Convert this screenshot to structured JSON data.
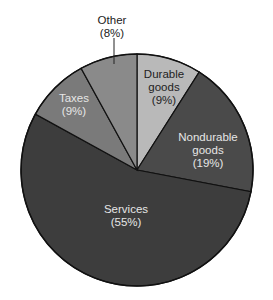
{
  "chart_data": {
    "type": "pie",
    "title": "",
    "categories": [
      "Durable goods",
      "Nondurable goods",
      "Services",
      "Taxes",
      "Other"
    ],
    "values": [
      9,
      19,
      55,
      9,
      8
    ],
    "unit": "%",
    "labels": [
      {
        "line1": "Durable",
        "line2": "goods",
        "line3": "(9%)"
      },
      {
        "line1": "Nondurable",
        "line2": "goods",
        "line3": "(19%)"
      },
      {
        "line1": "Services",
        "line2": "(55%)"
      },
      {
        "line1": "Taxes",
        "line2": "(9%)"
      },
      {
        "line1": "Other",
        "line2": "(8%)"
      }
    ],
    "colors": [
      "#b9b9b9",
      "#4a4a4a",
      "#3d3d3d",
      "#7a7a7a",
      "#8a8a8a"
    ],
    "legend": "none (inline labels)"
  }
}
